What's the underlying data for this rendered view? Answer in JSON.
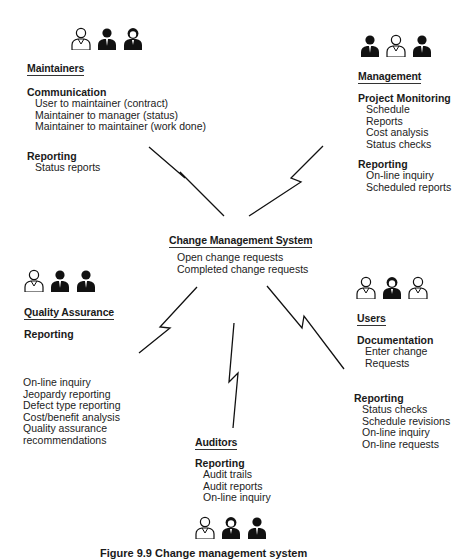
{
  "center": {
    "title": "Change Management System",
    "items": [
      "Open change requests",
      "Completed change requests"
    ]
  },
  "maintainers": {
    "title": "Maintainers",
    "icons": [
      "person-icon",
      "person-icon",
      "person-icon"
    ],
    "groups": [
      {
        "heading": "Communication",
        "items": [
          "User to maintainer (contract)",
          "Maintainer to manager (status)",
          "Maintainer to maintainer (work done)"
        ]
      },
      {
        "heading": "Reporting",
        "items": [
          "Status reports"
        ]
      }
    ]
  },
  "management": {
    "title": "Management",
    "icons": [
      "person-icon",
      "person-icon",
      "person-icon"
    ],
    "groups": [
      {
        "heading": "Project Monitoring",
        "items": [
          "Schedule",
          "Reports",
          "Cost analysis",
          "Status checks"
        ]
      },
      {
        "heading": "Reporting",
        "items": [
          "On-line inquiry",
          "Scheduled reports"
        ]
      }
    ]
  },
  "quality_assurance": {
    "title": "Quality Assurance",
    "icons": [
      "person-icon",
      "person-icon",
      "person-icon"
    ],
    "groups": [
      {
        "heading": "Reporting",
        "items": []
      }
    ],
    "items": [
      "On-line inquiry",
      "Jeopardy reporting",
      "Defect type reporting",
      "Cost/benefit analysis",
      "Quality assurance",
      "recommendations"
    ]
  },
  "users": {
    "title": "Users",
    "icons": [
      "person-icon",
      "person-icon",
      "person-icon"
    ],
    "groups": [
      {
        "heading": "Documentation",
        "items": [
          "Enter change",
          "Requests"
        ]
      },
      {
        "heading": "Reporting",
        "items": [
          "Status checks",
          "Schedule revisions",
          "On-line inquiry",
          "On-line requests"
        ]
      }
    ]
  },
  "auditors": {
    "title": "Auditors",
    "icons": [
      "person-icon",
      "person-icon",
      "person-icon"
    ],
    "groups": [
      {
        "heading": "Reporting",
        "items": [
          "Audit trails",
          "Audit reports",
          "On-line inquiry"
        ]
      }
    ]
  },
  "caption": "Figure 9.9  Change management system"
}
